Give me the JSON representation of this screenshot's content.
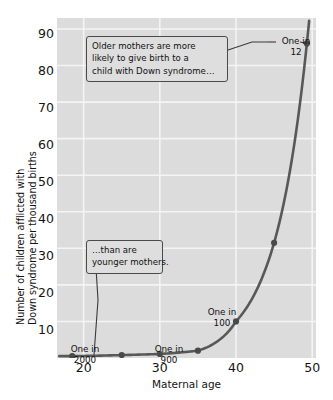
{
  "chart_data": {
    "type": "line",
    "title": "",
    "subtitle": "",
    "xlabel": "Maternal age",
    "ylabel_line1": "Number of children afflicted with",
    "ylabel_line2": "Down syndrome per thousand births",
    "xlim": [
      16.5,
      50.5
    ],
    "ylim": [
      0,
      93
    ],
    "xticks": [
      20,
      30,
      40,
      50
    ],
    "xtick_labels": [
      "20",
      "30",
      "40",
      "50"
    ],
    "yticks": [
      10,
      20,
      30,
      40,
      50,
      60,
      70,
      80,
      90
    ],
    "ytick_labels": [
      "10",
      "20",
      "30",
      "40",
      "50",
      "60",
      "70",
      "80",
      "90"
    ],
    "grid": true,
    "grid_color": "#f2f2f2",
    "plot_background": "#dcdcdc",
    "line_color": "#585858",
    "marker_color": "#4a4a4a",
    "legend": null,
    "x": [
      18.5,
      25,
      30,
      35,
      40,
      45,
      49.3
    ],
    "y": [
      0.5,
      0.8,
      1.1,
      2.0,
      10.0,
      31.5,
      86.0
    ],
    "points": [
      {
        "x": 18.5,
        "y": 0.5,
        "label": "One in 2000"
      },
      {
        "x": 25,
        "y": 0.8,
        "label": ""
      },
      {
        "x": 30,
        "y": 1.1,
        "label": "One in 900"
      },
      {
        "x": 35,
        "y": 2.0,
        "label": ""
      },
      {
        "x": 40,
        "y": 10.0,
        "label": "One in 100"
      },
      {
        "x": 45,
        "y": 31.5,
        "label": ""
      },
      {
        "x": 49.3,
        "y": 86.0,
        "label": "One in 12"
      }
    ],
    "point_annotations": [
      {
        "name": "one-in-2000",
        "line1": "One in",
        "line2": "2000"
      },
      {
        "name": "one-in-900",
        "line1": "One in",
        "line2": "900"
      },
      {
        "name": "one-in-100",
        "line1": "One in",
        "line2": "100"
      },
      {
        "name": "one-in-12",
        "line1": "One in",
        "line2": "12"
      }
    ],
    "annotations": [
      {
        "name": "older-mothers-callout",
        "lines": [
          "Older mothers are more",
          "likely to give birth to a",
          "child with Down syndrome…"
        ],
        "points_to": "one-in-12"
      },
      {
        "name": "younger-mothers-callout",
        "lines": [
          "…than are",
          "younger mothers."
        ],
        "points_to": "one-in-2000"
      }
    ]
  },
  "axis": {
    "x_title": "Maternal age",
    "y_title_line1": "Number of children afflicted with",
    "y_title_line2": "Down syndrome per thousand births",
    "ytick_0": "90",
    "ytick_1": "80",
    "ytick_2": "70",
    "ytick_3": "60",
    "ytick_4": "50",
    "ytick_5": "40",
    "ytick_6": "30",
    "ytick_7": "20",
    "ytick_8": "10",
    "xtick_0": "20",
    "xtick_1": "30",
    "xtick_2": "40",
    "xtick_3": "50"
  },
  "callouts": {
    "older": {
      "line1": "Older mothers are more",
      "line2": "likely to give birth to a",
      "line3": "child with Down syndrome…"
    },
    "younger": {
      "line1": "…than are",
      "line2": "younger mothers."
    }
  },
  "notes": {
    "n12": {
      "line1": "One in",
      "line2": "12"
    },
    "n2000": {
      "line1": "One in",
      "line2": "2000"
    },
    "n900": {
      "line1": "One in",
      "line2": "900"
    },
    "n100": {
      "line1": "One in",
      "line2": "100"
    }
  }
}
